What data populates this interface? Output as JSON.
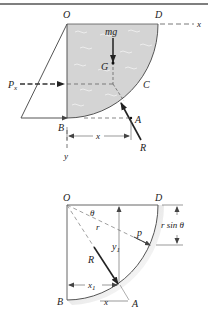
{
  "figure_top": {
    "title": "Fluid quarter-cylinder free-body diagram",
    "labels": {
      "O": "O",
      "D": "D",
      "x_axis": "x",
      "y_axis": "y",
      "mg": "mg",
      "G": "G",
      "C": "C",
      "Px": "P",
      "Px_sub": "x",
      "B": "B",
      "A": "A",
      "x_dim": "x",
      "R": "R"
    },
    "colors": {
      "fluid": "#d4d4d4",
      "line": "#333333"
    }
  },
  "figure_bottom": {
    "title": "Geometry of resultant R on circular arc",
    "labels": {
      "O": "O",
      "D": "D",
      "theta": "θ",
      "r": "r",
      "p": "p",
      "r_sin_theta": "r sin θ",
      "y1": "y",
      "y1_sub": "1",
      "R": "R",
      "x1": "x",
      "x1_sub": "1",
      "B": "B",
      "x_dim": "x",
      "A": "A"
    }
  }
}
